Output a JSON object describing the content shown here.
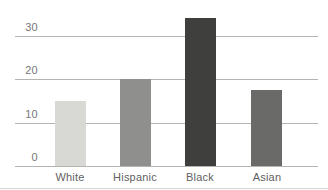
{
  "chart_data": {
    "type": "bar",
    "categories": [
      "White",
      "Hispanic",
      "Black",
      "Asian"
    ],
    "values": [
      15,
      20,
      34,
      17.5
    ],
    "title": "",
    "xlabel": "",
    "ylabel": "",
    "ylim": [
      0,
      35
    ],
    "yticks": [
      0,
      10,
      20,
      30
    ],
    "grid": true,
    "legend": false,
    "bar_colors": [
      "#d8d8d4",
      "#8f8f8d",
      "#3f3f3d",
      "#6a6a68"
    ],
    "gridline_color": "#b3b3af",
    "tick_label_color": "#77777a",
    "category_label_color": "#5f5f62",
    "figure_rule_color": "#d6d6d2",
    "background": "#ffffff"
  }
}
